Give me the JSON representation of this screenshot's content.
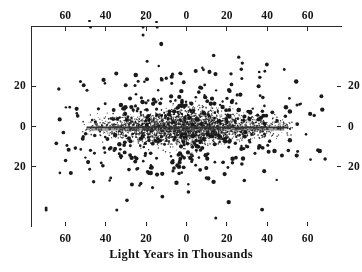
{
  "figure": {
    "title": "",
    "xlabel": "Light Years in Thousands",
    "ylabel": ""
  },
  "axes": {
    "top_ticklabels": [
      "60",
      "40",
      "20",
      "0",
      "20",
      "40",
      "60"
    ],
    "bottom_ticklabels": [
      "60",
      "40",
      "20",
      "0",
      "20",
      "40",
      "60"
    ],
    "left_ticklabels": [
      "20",
      "0",
      "20"
    ],
    "right_ticklabels": [
      "20",
      "0",
      "20"
    ]
  },
  "colors": {
    "frame": "#2a2a2a",
    "point": "#1a1a1a",
    "disk_line": "#333333",
    "background": "#ffffff"
  },
  "chart_data": {
    "type": "scatter",
    "title": "",
    "xlabel": "Light Years in Thousands",
    "ylabel": "",
    "xlim": [
      -77,
      77
    ],
    "ylim": [
      -50,
      50
    ],
    "grid": false,
    "legend": null,
    "x_tick_values": [
      -60,
      -40,
      -20,
      0,
      20,
      40,
      60
    ],
    "x_tick_labels": [
      "60",
      "40",
      "20",
      "0",
      "20",
      "40",
      "60"
    ],
    "y_tick_values": [
      20,
      0,
      -20
    ],
    "y_tick_labels": [
      "20",
      "0",
      "20"
    ],
    "axis_note": "x tick labels are unsigned distances from galactic center; both directions read 0,20,40,60",
    "series": [
      {
        "name": "galactic-disk",
        "description": "dense thin disk of small dots concentrated near y=0",
        "marker": "dot",
        "marker_size_px": 1.1,
        "count": 2600,
        "x_extent": [
          -52,
          52
        ],
        "y_scale_thickness": 4.5,
        "radial_falloff": "gaussian"
      },
      {
        "name": "galactic-halo",
        "description": "sparse scattered halo of larger dots surrounding the disk",
        "marker": "dot",
        "marker_size_px": 2.6,
        "count": 430,
        "x_extent": [
          -72,
          72
        ],
        "y_extent": [
          -42,
          42
        ],
        "radial_falloff": "elliptical-gaussian"
      },
      {
        "name": "outliers",
        "description": "isolated far dots beyond the main halo including above the top axis",
        "marker": "dot",
        "marker_size_px": 2.8,
        "count": 9,
        "points": [
          [
            -22,
            50
          ],
          [
            -22,
            46
          ],
          [
            -15,
            50
          ],
          [
            -48,
            50
          ],
          [
            -70,
            -40
          ],
          [
            -70,
            -41
          ],
          [
            -35,
            -41
          ],
          [
            14,
            -45
          ],
          [
            -20,
            33
          ]
        ]
      }
    ],
    "annotations": [
      {
        "type": "line",
        "name": "disk-midplane",
        "x_from": -50,
        "x_to": 50,
        "y": 0,
        "thickness_px": 2
      }
    ]
  }
}
